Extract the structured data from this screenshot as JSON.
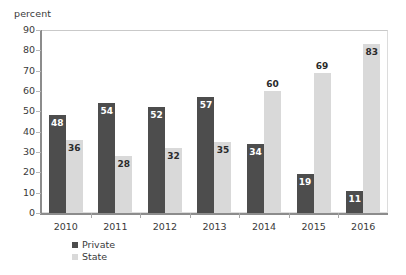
{
  "chart_data": {
    "type": "bar",
    "title": "",
    "subtitle": "",
    "xlabel": "",
    "ylabel": "percent",
    "ylim": [
      0,
      90
    ],
    "ytick_step": 10,
    "yticks": [
      90,
      80,
      70,
      60,
      50,
      40,
      30,
      20,
      10,
      0
    ],
    "grid": false,
    "legend_position": "bottom-left",
    "categories": [
      "2010",
      "2011",
      "2012",
      "2013",
      "2014",
      "2015",
      "2016"
    ],
    "series": [
      {
        "name": "Private",
        "color": "#4d4d4d",
        "values": [
          48,
          54,
          52,
          57,
          34,
          19,
          11
        ],
        "label_placement": [
          "inside",
          "inside",
          "inside",
          "inside",
          "inside",
          "inside",
          "inside"
        ]
      },
      {
        "name": "State",
        "color": "#d9d9d9",
        "values": [
          36,
          28,
          32,
          35,
          60,
          69,
          83
        ],
        "label_placement": [
          "inside",
          "inside",
          "inside",
          "inside",
          "above",
          "above",
          "inside"
        ]
      }
    ]
  },
  "axis": {
    "y_title": "percent"
  },
  "legend": {
    "items": [
      {
        "label": "Private",
        "swatch": "private"
      },
      {
        "label": "State",
        "swatch": "state"
      }
    ]
  }
}
